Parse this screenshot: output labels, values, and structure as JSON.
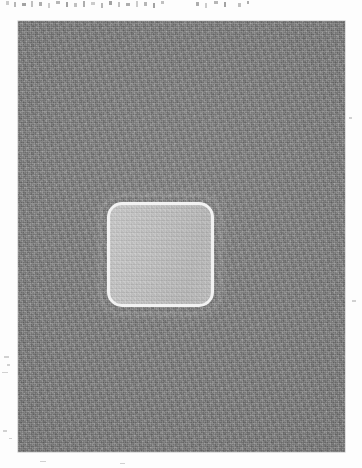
{
  "page": {
    "width_px": 362,
    "height_px": 468,
    "background_color": "#fdfdfd",
    "kind": "scanned-page-figure",
    "caption_text": ""
  },
  "clipped_text_band": {
    "description": "bottom tips of a cut-off line of printed text at the very top edge of the scan",
    "legible": false,
    "text": "",
    "color": "#8d8d8d",
    "glyph_tails": [
      {
        "left_px": 6,
        "width_px": 3,
        "height_px": 4
      },
      {
        "left_px": 14,
        "width_px": 2,
        "height_px": 5
      },
      {
        "left_px": 22,
        "width_px": 4,
        "height_px": 3
      },
      {
        "left_px": 31,
        "width_px": 2,
        "height_px": 6
      },
      {
        "left_px": 39,
        "width_px": 3,
        "height_px": 4
      },
      {
        "left_px": 48,
        "width_px": 2,
        "height_px": 5
      },
      {
        "left_px": 56,
        "width_px": 4,
        "height_px": 3
      },
      {
        "left_px": 66,
        "width_px": 2,
        "height_px": 5
      },
      {
        "left_px": 74,
        "width_px": 3,
        "height_px": 4
      },
      {
        "left_px": 83,
        "width_px": 2,
        "height_px": 6
      },
      {
        "left_px": 91,
        "width_px": 4,
        "height_px": 3
      },
      {
        "left_px": 101,
        "width_px": 2,
        "height_px": 5
      },
      {
        "left_px": 109,
        "width_px": 3,
        "height_px": 4
      },
      {
        "left_px": 118,
        "width_px": 2,
        "height_px": 5
      },
      {
        "left_px": 126,
        "width_px": 4,
        "height_px": 3
      },
      {
        "left_px": 136,
        "width_px": 2,
        "height_px": 6
      },
      {
        "left_px": 144,
        "width_px": 3,
        "height_px": 4
      },
      {
        "left_px": 153,
        "width_px": 2,
        "height_px": 5
      },
      {
        "left_px": 161,
        "width_px": 3,
        "height_px": 3
      },
      {
        "left_px": 196,
        "width_px": 3,
        "height_px": 4
      },
      {
        "left_px": 205,
        "width_px": 2,
        "height_px": 5
      },
      {
        "left_px": 214,
        "width_px": 4,
        "height_px": 3
      },
      {
        "left_px": 224,
        "width_px": 2,
        "height_px": 5
      },
      {
        "left_px": 238,
        "width_px": 3,
        "height_px": 4
      },
      {
        "left_px": 247,
        "width_px": 2,
        "height_px": 3
      }
    ]
  },
  "figure_panel": {
    "name": "grayscale-figure",
    "left_px": 18,
    "top_px": 21,
    "width_px": 327,
    "height_px": 431,
    "fill_color": "#828282",
    "texture": "film-grain / speckle noise",
    "label": ""
  },
  "roi": {
    "name": "rounded-square-region",
    "left_px": 107,
    "top_px": 202,
    "width_px": 107,
    "height_px": 105,
    "corner_radius_px": 15,
    "border_width_px": 3,
    "border_color": "#f2f2f2",
    "fill_color": "#c3c3c3",
    "label": ""
  },
  "margin_marks": [
    {
      "left_px": 4,
      "top_px": 356,
      "width_px": 5,
      "height_px": 2
    },
    {
      "left_px": 7,
      "top_px": 364,
      "width_px": 3,
      "height_px": 2
    },
    {
      "left_px": 2,
      "top_px": 372,
      "width_px": 6,
      "height_px": 1
    },
    {
      "left_px": 3,
      "top_px": 430,
      "width_px": 4,
      "height_px": 2
    },
    {
      "left_px": 9,
      "top_px": 438,
      "width_px": 3,
      "height_px": 1
    },
    {
      "left_px": 352,
      "top_px": 300,
      "width_px": 4,
      "height_px": 2
    },
    {
      "left_px": 349,
      "top_px": 117,
      "width_px": 3,
      "height_px": 2
    },
    {
      "left_px": 40,
      "top_px": 461,
      "width_px": 6,
      "height_px": 1
    },
    {
      "left_px": 120,
      "top_px": 463,
      "width_px": 5,
      "height_px": 1
    }
  ]
}
